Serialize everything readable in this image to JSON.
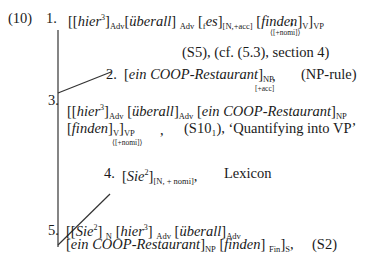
{
  "example_number": "(10)",
  "steps": [
    {
      "num": "1.",
      "formula": {
        "a_word": "hier",
        "a_sup": "3",
        "a_cat": "Adv",
        "b_word": "überall",
        "b_cat": "Adv",
        "c_pre": "f",
        "c_word": "es",
        "c_cat": "[N,+acc]",
        "d_word": "finden",
        "d_cat": "V",
        "phrase_cat": "VP",
        "feature": "⟨[+nomi]⟩"
      },
      "comma": ",",
      "justification": "(S5), (cf. (5.3), section 4)"
    },
    {
      "num": "2.",
      "formula": {
        "word": "ein COOP-Restaurant",
        "cat": "NP",
        "feature": "[+acc]"
      },
      "comma": ",",
      "justification": "(NP-rule)"
    },
    {
      "num": "3.",
      "formula": {
        "a_word": "hier",
        "a_sup": "3",
        "a_cat": "Adv",
        "b_word": "überall",
        "b_cat": "Adv",
        "c_word": "ein COOP-Restaurant",
        "c_cat": "NP",
        "d_word": "finden",
        "d_cat": "V",
        "phrase_cat": "VP",
        "feature": "⟨[+nomi]⟩"
      },
      "comma": ",",
      "justification": "(S10₁), ‘Quantifying into VP’"
    },
    {
      "num": "4.",
      "formula": {
        "word": "Sie",
        "sup": "2",
        "cat": "[N, + nomi]"
      },
      "comma": ",",
      "justification": "Lexicon"
    },
    {
      "num": "5.",
      "formula": {
        "a_word": "Sie",
        "a_sup": "2",
        "a_cat": "N",
        "b_word": "hier",
        "b_sup": "3",
        "b_cat": "Adv",
        "c_word": "überall",
        "c_cat": "Adv",
        "d_word": "ein COOP-Restaurant",
        "d_cat": "NP",
        "e_word": "finden",
        "e_cat": "Fin",
        "phrase_cat": "S"
      },
      "comma": ",",
      "justification": "(S2)"
    }
  ]
}
